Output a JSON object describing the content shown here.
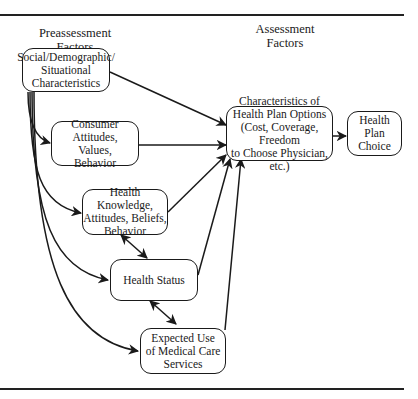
{
  "headings": {
    "preassessment": "Preassessment\nFactors",
    "assessment": "Assessment\nFactors"
  },
  "nodes": {
    "social": "Social/Demographic/\nSituational\nCharacteristics",
    "consumer": "Consumer Attitudes,\nValues,\nBehavior",
    "knowledge": "Health Knowledge,\nAttitudes, Beliefs,\nBehavior",
    "status": "Health Status",
    "expected_use": "Expected Use\nof Medical Care\nServices",
    "characteristics": "Characteristics of\nHealth Plan Options\n(Cost, Coverage, Freedom\nto Choose Physician, etc.)",
    "choice": "Health\nPlan Choice"
  },
  "edges": [
    {
      "from": "social",
      "to": "characteristics",
      "type": "directed"
    },
    {
      "from": "social",
      "to": "consumer",
      "type": "directed"
    },
    {
      "from": "social",
      "to": "knowledge",
      "type": "directed"
    },
    {
      "from": "social",
      "to": "status",
      "type": "directed"
    },
    {
      "from": "social",
      "to": "expected_use",
      "type": "directed"
    },
    {
      "from": "consumer",
      "to": "characteristics",
      "type": "directed"
    },
    {
      "from": "knowledge",
      "to": "characteristics",
      "type": "directed"
    },
    {
      "from": "status",
      "to": "characteristics",
      "type": "directed"
    },
    {
      "from": "expected_use",
      "to": "characteristics",
      "type": "directed"
    },
    {
      "from": "knowledge",
      "to": "status",
      "type": "bidirectional"
    },
    {
      "from": "status",
      "to": "expected_use",
      "type": "bidirectional"
    },
    {
      "from": "characteristics",
      "to": "choice",
      "type": "directed"
    }
  ]
}
